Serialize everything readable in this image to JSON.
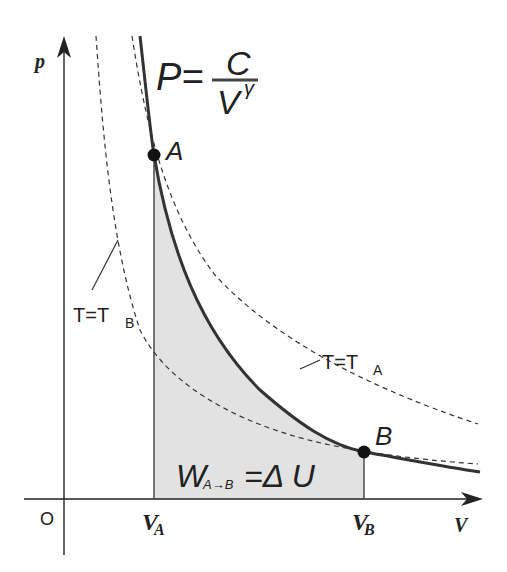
{
  "diagram": {
    "axes": {
      "y_label": "p",
      "x_label": "V",
      "origin_label": "O"
    },
    "formula": {
      "lhs": "P=",
      "numerator": "C",
      "denominator": "V",
      "exponent": "γ"
    },
    "points": [
      {
        "name": "A",
        "label": "A"
      },
      {
        "name": "B",
        "label": "B"
      }
    ],
    "ticks": {
      "va": {
        "main": "V",
        "sub": "A"
      },
      "vb": {
        "main": "V",
        "sub": "B"
      }
    },
    "isotherms": {
      "tb": {
        "main": "T=T",
        "sub": "B"
      },
      "ta": {
        "main": "T=T",
        "sub": "A"
      }
    },
    "work_label": {
      "main": "W",
      "sub": "A→B",
      "rest": "=Δ U"
    },
    "colors": {
      "curve": "#333333",
      "fill": "#e2e2e2",
      "axis": "#222222"
    }
  }
}
